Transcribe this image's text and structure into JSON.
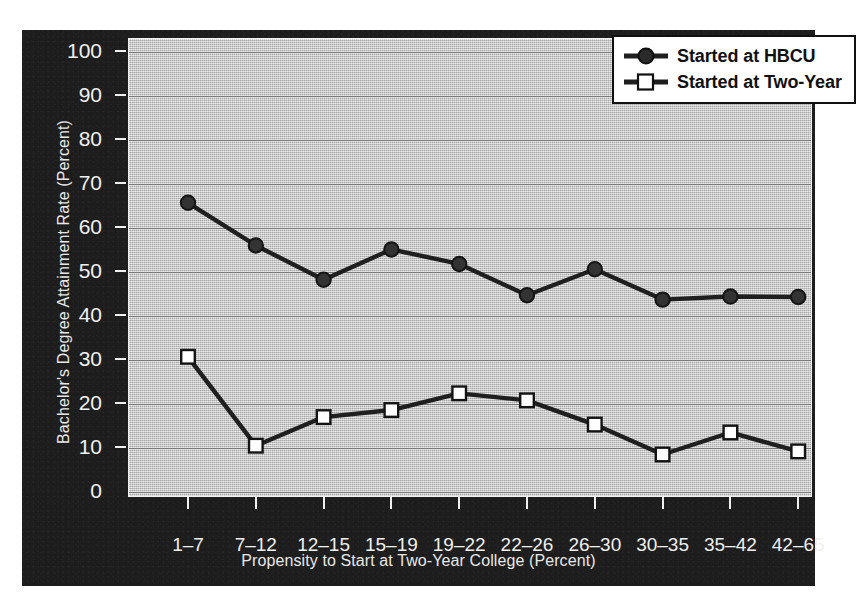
{
  "chart_data": {
    "type": "line",
    "title": "",
    "xlabel": "Propensity to Start at Two-Year College (Percent)",
    "ylabel": "Bachelor's Degree Attainment Rate (Percent)",
    "categories": [
      "1–7",
      "7–12",
      "12–15",
      "15–19",
      "19–22",
      "22–26",
      "26–30",
      "30–35",
      "35–42",
      "42–65"
    ],
    "ylim": [
      0,
      100
    ],
    "yticks": [
      0,
      10,
      20,
      30,
      40,
      50,
      60,
      70,
      80,
      90,
      100
    ],
    "ytick_labels": [
      "0",
      "10",
      "20",
      "30",
      "40",
      "50",
      "60",
      "70",
      "80",
      "90",
      "100"
    ],
    "grid": true,
    "legend_position": "top-right",
    "series": [
      {
        "name": "Started at HBCU",
        "marker": "filled-circle",
        "color": "#1f1f1f",
        "values": [
          65.5,
          55.8,
          48.0,
          54.9,
          51.6,
          44.5,
          50.4,
          43.5,
          44.2,
          44.1
        ]
      },
      {
        "name": "Started at Two-Year",
        "marker": "open-square",
        "color": "#1f1f1f",
        "marker_fill": "#ffffff",
        "values": [
          30.5,
          10.3,
          16.8,
          18.4,
          22.2,
          20.6,
          15.1,
          8.3,
          13.3,
          9.0
        ]
      }
    ]
  },
  "legend": {
    "items": [
      {
        "label": "Started at HBCU",
        "marker": "filled-circle"
      },
      {
        "label": "Started at Two-Year",
        "marker": "open-square"
      }
    ]
  },
  "colors": {
    "panel_background": "#1d1d1d",
    "plot_background": "#bdbdbd",
    "gridline": "#6d6d6d",
    "series_line": "#1f1f1f",
    "tick_text": "#f0f0f0",
    "legend_background": "#ffffff",
    "legend_border": "#101010"
  }
}
